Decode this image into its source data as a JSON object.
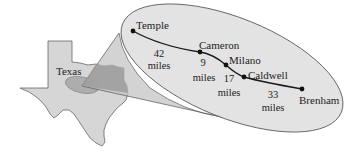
{
  "diagram": {
    "state_label": "Texas",
    "colors": {
      "state_fill": "#d6d6d6",
      "state_stroke": "#666666",
      "highlight_region": "#a9a9a9",
      "cone_fill": "#c4c4c4",
      "ellipse_fill": "#e3e3e3",
      "route_line": "#1a1a1a"
    },
    "cities": [
      {
        "name": "Temple"
      },
      {
        "name": "Cameron"
      },
      {
        "name": "Milano"
      },
      {
        "name": "Caldwell"
      },
      {
        "name": "Brenham"
      }
    ],
    "segments": [
      {
        "from": "Temple",
        "to": "Cameron",
        "distance": "42",
        "unit": "miles"
      },
      {
        "from": "Cameron",
        "to": "Milano",
        "distance": "9",
        "unit": "miles"
      },
      {
        "from": "Milano",
        "to": "Caldwell",
        "distance": "17",
        "unit": "miles"
      },
      {
        "from": "Caldwell",
        "to": "Brenham",
        "distance": "33",
        "unit": "miles"
      }
    ]
  }
}
